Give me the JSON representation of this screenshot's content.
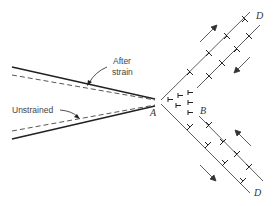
{
  "diagram": {
    "labels": {
      "after_strain_line1": "After",
      "after_strain_line2": "strain",
      "unstrained": "Unstrained",
      "point_a": "A",
      "point_b": "B",
      "point_d_top": "D",
      "point_d_bottom": "D"
    },
    "colors": {
      "line": "#222222",
      "dashed": "#444444",
      "text": "#333333"
    }
  }
}
